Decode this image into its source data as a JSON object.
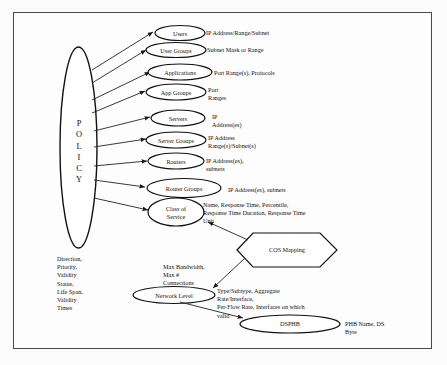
{
  "diagram": {
    "frame": {
      "border_color": "#4a4a4a",
      "background": "#fdfdfd"
    }
  },
  "policy": {
    "label": "POLICY",
    "letters": [
      "P",
      "O",
      "L",
      "I",
      "C",
      "Y"
    ],
    "attributes": "Direction,\nPriority,\nValidity\nStatus,\nLife Span,\nValidity\nTimes"
  },
  "entities": [
    {
      "name": "Users",
      "attributes": "IP Address/Range/Subnet"
    },
    {
      "name": "User Groups",
      "attributes": "Subnet Mask or Range"
    },
    {
      "name": "Applications",
      "attributes": "Port Range(s), Protocols"
    },
    {
      "name": "App Groups",
      "attributes": "Port\nRanges"
    },
    {
      "name": "Servers",
      "attributes": "IP\nAddress(es)"
    },
    {
      "name": "Server Groups",
      "attributes": "IP Address\nRange(s)/Subnet(s)"
    },
    {
      "name": "Routers",
      "attributes": "IP Address(es),\nsubnets"
    },
    {
      "name": "Router Groups",
      "attributes": "IP Address(es), subnets"
    },
    {
      "name": "Class of\nService",
      "attributes": "Name, Response Time, Percentile,\nResponse Time Duration, Response Time\nUnit"
    }
  ],
  "cos_mapping": {
    "name": "COS Mapping"
  },
  "network_level": {
    "name": "Network Level",
    "attributes": "Type/Subtype, Aggregate\nRate/Interface,\nPer-Flow Rate, Interfaces on which\nvalid",
    "edge_label": "Max Bandwidth,\nMax #\nConnections"
  },
  "dsphb": {
    "name": "DSPHB",
    "attributes": "PHB Name, DS\nByte"
  }
}
